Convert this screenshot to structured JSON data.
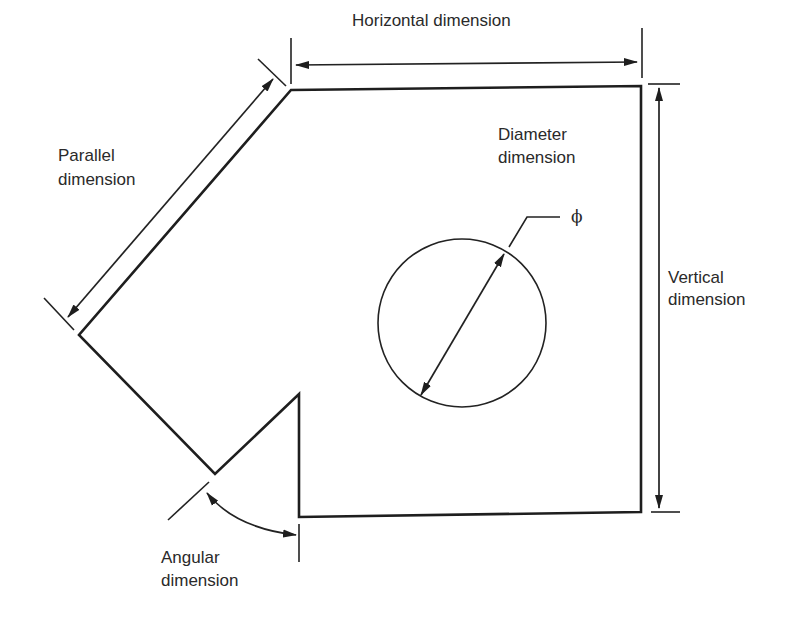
{
  "diagram": {
    "type": "engineering-dimensioning",
    "colors": {
      "line": "#1e1e1e",
      "text": "#2a2a2a",
      "background": "#ffffff"
    },
    "labels": {
      "horizontal": "Horizontal dimension",
      "parallel_line1": "Parallel",
      "parallel_line2": "dimension",
      "diameter_line1": "Diameter",
      "diameter_line2": "dimension",
      "diameter_symbol": "ϕ",
      "vertical_line1": "Vertical",
      "vertical_line2": "dimension",
      "angular_line1": "Angular",
      "angular_line2": "dimension"
    },
    "shape": {
      "description": "Plate with chamfered top-left edge, V-notch on lower left, and a circular hole",
      "vertices": [
        [
          291,
          90
        ],
        [
          641,
          86
        ],
        [
          641,
          512
        ],
        [
          299,
          517
        ],
        [
          299,
          394
        ],
        [
          215,
          474
        ],
        [
          79,
          335
        ]
      ],
      "hole": {
        "cx": 462,
        "cy": 323,
        "r": 84
      }
    }
  }
}
